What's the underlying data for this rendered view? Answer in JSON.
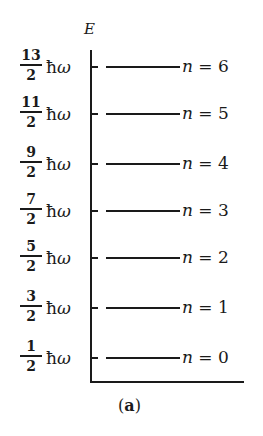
{
  "diagram": {
    "axis_label": "E",
    "unit_symbol": "ħ",
    "unit_omega": "ω",
    "caption_open": "(",
    "caption_letter": "a",
    "caption_close": ")",
    "levels": [
      {
        "numerator": "13",
        "denominator": "2",
        "n_symbol": "n",
        "equals": " = ",
        "n_value": "6",
        "top": 48
      },
      {
        "numerator": "11",
        "denominator": "2",
        "n_symbol": "n",
        "equals": " = ",
        "n_value": "5",
        "top": 95
      },
      {
        "numerator": "9",
        "denominator": "2",
        "n_symbol": "n",
        "equals": " = ",
        "n_value": "4",
        "top": 145
      },
      {
        "numerator": "7",
        "denominator": "2",
        "n_symbol": "n",
        "equals": " = ",
        "n_value": "3",
        "top": 192
      },
      {
        "numerator": "5",
        "denominator": "2",
        "n_symbol": "n",
        "equals": " = ",
        "n_value": "2",
        "top": 239
      },
      {
        "numerator": "3",
        "denominator": "2",
        "n_symbol": "n",
        "equals": " = ",
        "n_value": "1",
        "top": 289
      },
      {
        "numerator": "1",
        "denominator": "2",
        "n_symbol": "n",
        "equals": " = ",
        "n_value": "0",
        "top": 339
      }
    ]
  }
}
